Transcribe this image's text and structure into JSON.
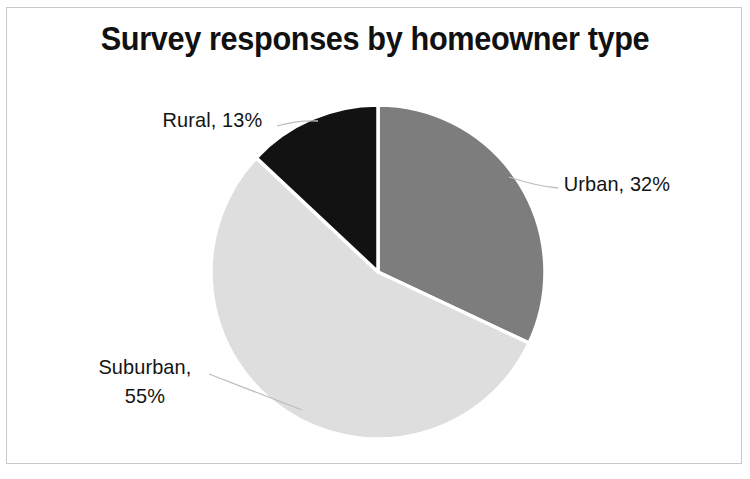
{
  "chart_data": {
    "type": "pie",
    "title": "Survey responses by homeowner type",
    "xlabel": "",
    "ylabel": "",
    "legend": "none",
    "grid": false,
    "start_angle_deg": 0,
    "direction": "clockwise",
    "categories": [
      "Urban",
      "Suburban",
      "Rural"
    ],
    "values": [
      32,
      55,
      13
    ],
    "unit": "%",
    "labels": [
      "Urban, 32%",
      "Suburban, 55%",
      "Rural, 13%"
    ],
    "colors": [
      "#7d7d7d",
      "#dedede",
      "#121212"
    ],
    "slice_separator_color": "#ffffff"
  },
  "title": {
    "text": "Survey responses by homeowner type"
  },
  "slices": {
    "urban": {
      "name": "Urban",
      "value": 32,
      "label": "Urban, 32%",
      "color": "#7d7d7d"
    },
    "suburban": {
      "name": "Suburban",
      "value": 55,
      "label_line1": "Suburban,",
      "label_line2": "55%",
      "label": "Suburban, 55%",
      "color": "#dedede"
    },
    "rural": {
      "name": "Rural",
      "value": 13,
      "label": "Rural, 13%",
      "color": "#121212"
    }
  }
}
